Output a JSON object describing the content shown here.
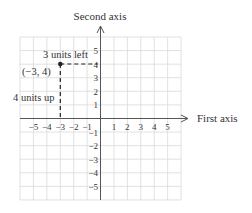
{
  "diagram": {
    "x_axis_label": "First axis",
    "y_axis_label": "Second axis",
    "x_ticks": [
      "−5",
      "−4",
      "−3",
      "−2",
      "−1",
      "1",
      "2",
      "3",
      "4",
      "5"
    ],
    "y_ticks_pos": [
      "5",
      "4",
      "3",
      "2",
      "1"
    ],
    "y_ticks_neg": [
      "−1",
      "−2",
      "−3",
      "−4",
      "−5"
    ],
    "point": {
      "x": -3,
      "y": 4,
      "label": "(−3, 4)"
    },
    "annotations": {
      "horizontal": "3 units left",
      "vertical": "4 units up"
    },
    "colors": {
      "grid": "#d9d9d9",
      "axis": "#444444",
      "point": "#222222"
    }
  }
}
